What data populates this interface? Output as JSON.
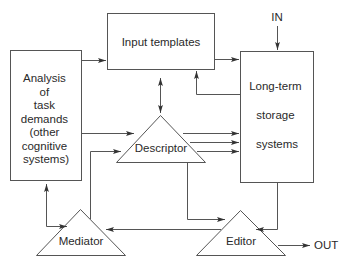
{
  "diagram": {
    "nodes": {
      "analysis": {
        "shape": "rectangle",
        "lines": [
          "Analysis",
          "of",
          "task",
          "demands",
          "(other",
          "cognitive",
          "systems)"
        ]
      },
      "input_templates": {
        "shape": "rectangle",
        "label": "Input templates"
      },
      "long_term_storage": {
        "shape": "rectangle",
        "lines": [
          "Long-term",
          "storage",
          "systems"
        ]
      },
      "descriptor": {
        "shape": "triangle",
        "label": "Descriptor"
      },
      "mediator": {
        "shape": "triangle",
        "label": "Mediator"
      },
      "editor": {
        "shape": "triangle",
        "label": "Editor"
      }
    },
    "terminals": {
      "in": "IN",
      "out": "OUT"
    },
    "edges": [
      {
        "from": "analysis",
        "to": "input_templates",
        "type": "arrow"
      },
      {
        "from": "input_templates",
        "to": "long_term_storage",
        "type": "arrow"
      },
      {
        "from": "long_term_storage",
        "to": "input_templates",
        "type": "arrow"
      },
      {
        "from": "input_templates",
        "to": "descriptor",
        "type": "bidirectional"
      },
      {
        "from": "analysis",
        "to": "descriptor",
        "type": "arrow"
      },
      {
        "from": "mediator",
        "to": "descriptor",
        "type": "arrow"
      },
      {
        "from": "descriptor",
        "to": "long_term_storage",
        "type": "arrow",
        "count": 3
      },
      {
        "from": "descriptor",
        "to": "editor",
        "type": "arrow"
      },
      {
        "from": "long_term_storage",
        "to": "editor",
        "type": "arrow"
      },
      {
        "from": "editor",
        "to": "mediator",
        "type": "arrow"
      },
      {
        "from": "analysis",
        "to": "mediator",
        "type": "bidirectional"
      },
      {
        "from": "in",
        "to": "long_term_storage",
        "type": "arrow"
      },
      {
        "from": "editor",
        "to": "out",
        "type": "arrow"
      }
    ]
  }
}
